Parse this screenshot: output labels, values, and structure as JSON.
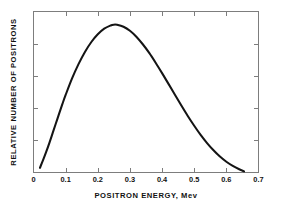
{
  "chart_data": {
    "type": "line",
    "title": "",
    "xlabel": "POSITRON ENERGY, Mev",
    "ylabel": "RELATIVE NUMBER OF POSITRONS",
    "xlim": [
      0,
      0.7
    ],
    "ylim": [
      0,
      1
    ],
    "grid": false,
    "legend": null,
    "x_ticks": [
      0,
      0.1,
      0.2,
      0.3,
      0.4,
      0.5,
      0.6,
      0.7
    ],
    "x_tick_labels": [
      "0",
      "0.1",
      "0.2",
      "0.3",
      "0.4",
      "0.5",
      "0.6",
      "0.7"
    ],
    "y_ticks": [
      0,
      0.2,
      0.4,
      0.6,
      0.8,
      1
    ],
    "y_tick_labels": [
      "",
      "",
      "",
      "",
      "",
      ""
    ],
    "series": [
      {
        "name": "positron energy spectrum",
        "x": [
          0.02,
          0.03,
          0.04,
          0.05,
          0.06,
          0.07,
          0.08,
          0.09,
          0.1,
          0.12,
          0.14,
          0.16,
          0.18,
          0.2,
          0.22,
          0.24,
          0.25,
          0.26,
          0.28,
          0.3,
          0.32,
          0.34,
          0.36,
          0.38,
          0.4,
          0.42,
          0.44,
          0.46,
          0.48,
          0.5,
          0.52,
          0.54,
          0.56,
          0.58,
          0.6,
          0.62,
          0.64,
          0.655
        ],
        "y": [
          0.026,
          0.075,
          0.128,
          0.185,
          0.245,
          0.305,
          0.365,
          0.424,
          0.48,
          0.583,
          0.672,
          0.748,
          0.81,
          0.858,
          0.893,
          0.913,
          0.918,
          0.917,
          0.905,
          0.88,
          0.843,
          0.796,
          0.742,
          0.681,
          0.616,
          0.549,
          0.481,
          0.414,
          0.349,
          0.288,
          0.231,
          0.18,
          0.135,
          0.096,
          0.064,
          0.038,
          0.017,
          0.004
        ]
      }
    ],
    "annotations": []
  },
  "axes": {
    "x_axis_label": "POSITRON ENERGY, Mev",
    "y_axis_label": "RELATIVE NUMBER OF POSITRONS",
    "x_tick_labels": [
      "0",
      "0.1",
      "0.2",
      "0.3",
      "0.4",
      "0.5",
      "0.6",
      "0.7"
    ]
  },
  "colors": {
    "curve": "#141414",
    "frame": "#7d7d7d",
    "text": "#111111",
    "background": "#ffffff"
  }
}
